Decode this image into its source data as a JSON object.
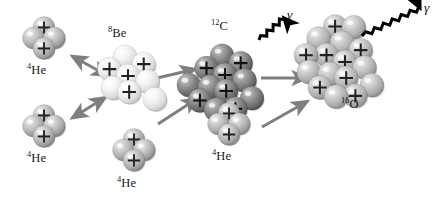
{
  "figure": {
    "width": 437,
    "height": 199,
    "background": "#ffffff"
  },
  "palette": {
    "helium_sphere": "#b9b9b9",
    "helium_sphere_dark": "#8d8d8d",
    "beryllium_sphere": "#efefef",
    "beryllium_sphere_dark": "#cfcfcf",
    "carbon_sphere": "#8a8a8a",
    "carbon_sphere_dark": "#5a5a5a",
    "oxygen_sphere": "#bdbdbd",
    "oxygen_sphere_dark": "#8f8f8f",
    "reaction_arrow": "#7f7f7f",
    "gamma_arrow": "#000000",
    "proton_mark": "#222222",
    "label_text": "#1a1a1a"
  },
  "nuclei": [
    {
      "id": "he4-top-left",
      "label_mass": "4",
      "label_symbol": "He",
      "label_x": 27,
      "label_y": 64,
      "center_x": 44,
      "center_y": 38,
      "radius": 11,
      "shade": "helium",
      "nucleon_count": 4,
      "proton_count": 2
    },
    {
      "id": "he4-bottom-left",
      "label_mass": "4",
      "label_symbol": "He",
      "label_x": 27,
      "label_y": 152,
      "center_x": 44,
      "center_y": 126,
      "radius": 11,
      "shade": "helium",
      "nucleon_count": 4,
      "proton_count": 2
    },
    {
      "id": "be8",
      "label_mass": "8",
      "label_symbol": "Be",
      "label_x": 108,
      "label_y": 27,
      "center_x": 128,
      "center_y": 76,
      "radius": 12,
      "shade": "beryllium",
      "nucleon_count": 8,
      "proton_count": 4
    },
    {
      "id": "he4-center-bottom",
      "label_mass": "4",
      "label_symbol": "He",
      "label_x": 117,
      "label_y": 177,
      "center_x": 134,
      "center_y": 150,
      "radius": 11,
      "shade": "helium",
      "nucleon_count": 4,
      "proton_count": 2
    },
    {
      "id": "c12",
      "label_mass": "12",
      "label_symbol": "C",
      "label_x": 211,
      "label_y": 20,
      "center_x": 225,
      "center_y": 75,
      "radius": 12,
      "shade": "carbon",
      "nucleon_count": 12,
      "proton_count": 6
    },
    {
      "id": "he4-right-bottom",
      "label_mass": "4",
      "label_symbol": "He",
      "label_x": 212,
      "label_y": 150,
      "center_x": 229,
      "center_y": 124,
      "radius": 11,
      "shade": "helium",
      "nucleon_count": 4,
      "proton_count": 2
    },
    {
      "id": "o16",
      "label_mass": "16",
      "label_symbol": "O",
      "label_x": 341,
      "label_y": 98,
      "center_x": 345,
      "center_y": 62,
      "radius": 12,
      "shade": "oxygen",
      "nucleon_count": 16,
      "proton_count": 8
    }
  ],
  "reaction_arrows": [
    {
      "id": "arrow-he4-top-to-be8",
      "kind": "double",
      "x1": 72,
      "y1": 56,
      "x2": 108,
      "y2": 76
    },
    {
      "id": "arrow-he4-bottom-to-be8",
      "kind": "double",
      "x1": 72,
      "y1": 118,
      "x2": 106,
      "y2": 97
    },
    {
      "id": "arrow-be8-to-c12",
      "kind": "single",
      "x1": 157,
      "y1": 78,
      "x2": 196,
      "y2": 69
    },
    {
      "id": "arrow-he4-center-to-c12",
      "kind": "single",
      "x1": 158,
      "y1": 124,
      "x2": 198,
      "y2": 98
    },
    {
      "id": "arrow-c12-to-o16",
      "kind": "single",
      "x1": 261,
      "y1": 78,
      "x2": 308,
      "y2": 78
    },
    {
      "id": "arrow-he4-right-to-o16",
      "kind": "single",
      "x1": 262,
      "y1": 127,
      "x2": 308,
      "y2": 101
    }
  ],
  "gamma_emissions": [
    {
      "id": "gamma-c12",
      "label": "γ",
      "label_x": 287,
      "label_y": 8,
      "x1": 259,
      "y1": 40,
      "x2": 284,
      "y2": 18
    },
    {
      "id": "gamma-o16",
      "label": "γ",
      "label_x": 424,
      "label_y": 0,
      "x1": 362,
      "y1": 36,
      "x2": 420,
      "y2": 8
    }
  ]
}
